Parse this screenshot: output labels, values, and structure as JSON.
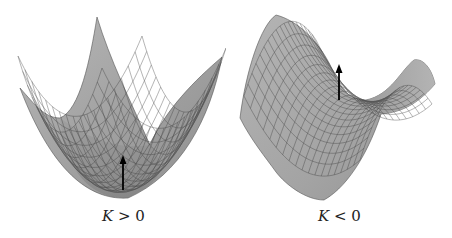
{
  "figure": {
    "panels": [
      {
        "id": "positive-curvature",
        "surface": "paraboloid",
        "label_var": "K",
        "label_rel": " > 0",
        "normal_vector": "upward arrow at bottom of bowl"
      },
      {
        "id": "negative-curvature",
        "surface": "saddle",
        "label_var": "K",
        "label_rel": " < 0",
        "normal_vector": "upward arrow at saddle point"
      }
    ],
    "colors": {
      "surface_fill": "#a8a8a8",
      "surface_dark": "#7c7c7c",
      "surface_light": "#c4c4c4",
      "grid": "#3a3a3a",
      "arrow": "#000000",
      "background": "#ffffff"
    }
  }
}
